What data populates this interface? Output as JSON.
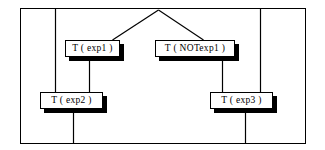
{
  "diagram": {
    "frame": {
      "name": "outer-frame",
      "x": 20,
      "y": 8,
      "width": 285,
      "height": 135,
      "stroke": "#000000"
    },
    "colors": {
      "line": "#000000",
      "box_fill": "#ffffff",
      "box_border": "#000000",
      "shadow": "#000000",
      "background": "#ffffff"
    },
    "nodes": [
      {
        "id": "exp1",
        "name": "node-exp1",
        "label": "T ( exp1 )",
        "x": 65,
        "y": 40,
        "width": 55,
        "height": 17
      },
      {
        "id": "notexp1",
        "name": "node-notexp1",
        "label": "T ( NOTexp1 )",
        "x": 155,
        "y": 40,
        "width": 80,
        "height": 17
      },
      {
        "id": "exp2",
        "name": "node-exp2",
        "label": "T ( exp2 )",
        "x": 40,
        "y": 92,
        "width": 63,
        "height": 17
      },
      {
        "id": "exp3",
        "name": "node-exp3",
        "label": "T ( exp3 )",
        "x": 210,
        "y": 92,
        "width": 63,
        "height": 17
      }
    ],
    "edges": [
      {
        "name": "edge-apex-to-exp1",
        "x1": 158,
        "y1": 10,
        "x2": 112,
        "y2": 40
      },
      {
        "name": "edge-apex-to-notexp1",
        "x1": 158,
        "y1": 10,
        "x2": 203,
        "y2": 40
      },
      {
        "name": "edge-exp1-to-exp2",
        "x1": 89,
        "y1": 57,
        "x2": 89,
        "y2": 92
      },
      {
        "name": "edge-notexp1-to-exp3",
        "x1": 222,
        "y1": 57,
        "x2": 222,
        "y2": 92
      },
      {
        "name": "edge-top-to-exp2",
        "x1": 55,
        "y1": 8,
        "x2": 55,
        "y2": 92
      },
      {
        "name": "edge-top-to-exp3",
        "x1": 260,
        "y1": 8,
        "x2": 260,
        "y2": 92
      },
      {
        "name": "edge-exp2-to-bottom",
        "x1": 73,
        "y1": 109,
        "x2": 73,
        "y2": 143
      },
      {
        "name": "edge-exp3-to-bottom",
        "x1": 245,
        "y1": 109,
        "x2": 245,
        "y2": 143
      }
    ]
  }
}
